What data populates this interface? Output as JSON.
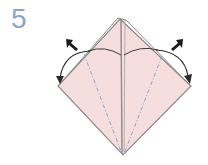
{
  "diagram": {
    "step_number": "5",
    "type": "origami-fold-instruction",
    "colors": {
      "paper_fill": "#f7dede",
      "paper_edge": "#8a8a8a",
      "center_crease": "#9a9a9a",
      "valley_fold": "#8fa3cf",
      "arrow": "#2a2a2a",
      "step_number": "#8ea3cf"
    },
    "elements": [
      "kite-shaped paper with center vertical layer",
      "left valley fold line (dash-dot)",
      "right valley fold line (dash-dot)",
      "left fold arrow (curved, pointing down-left)",
      "right fold arrow (curved, pointing down-right)",
      "left push arrow (black)",
      "right push arrow (black)"
    ]
  }
}
